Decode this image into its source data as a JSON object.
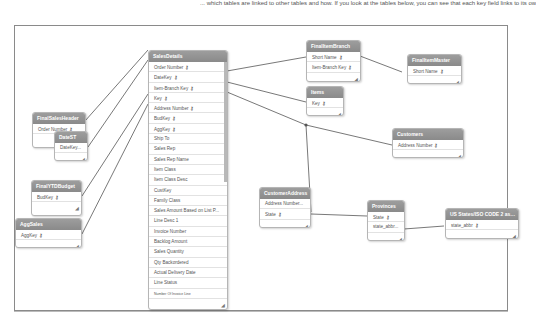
{
  "caption": "... which tables are linked to other tables and how. If you look at the tables below, you can see that each key field links to its own table.",
  "colors": {
    "header_bg": "#8f8f8f",
    "line": "#555555",
    "border": "#8a8a8a"
  },
  "tables": {
    "salesdetails": {
      "title": "SalesDetails",
      "fields": [
        {
          "name": "Order Number",
          "key": true
        },
        {
          "name": "DateKey",
          "key": true
        },
        {
          "name": "Item-Branch Key",
          "key": true
        },
        {
          "name": "Key",
          "key": true
        },
        {
          "name": "Address Number",
          "key": true
        },
        {
          "name": "BudKey",
          "key": true
        },
        {
          "name": "AggKey",
          "key": true
        },
        {
          "name": "Ship To",
          "key": false
        },
        {
          "name": "Sales Rep",
          "key": false
        },
        {
          "name": "Sales Rep Name",
          "key": false
        },
        {
          "name": "Item Class",
          "key": false
        },
        {
          "name": "Item Class Desc",
          "key": false
        },
        {
          "name": "CustKey",
          "key": false
        },
        {
          "name": "Family Class",
          "key": false
        },
        {
          "name": "Sales Amount Based on List P...",
          "key": false
        },
        {
          "name": "Line Desc 1",
          "key": false
        },
        {
          "name": "Invoice Number",
          "key": false
        },
        {
          "name": "Backlog Amount",
          "key": false
        },
        {
          "name": "Sales Quantity",
          "key": false
        },
        {
          "name": "Qty Backordered",
          "key": false
        },
        {
          "name": "Actual Delivery Date",
          "key": false
        },
        {
          "name": "Line Status",
          "key": false
        },
        {
          "name": "Number Of Invoice Line",
          "key": false
        }
      ]
    },
    "finalsalesheader": {
      "title": "FinalSalesHeader",
      "fields": [
        {
          "name": "Order Number",
          "key": true
        }
      ]
    },
    "datest": {
      "title": "DateST",
      "fields": [
        {
          "name": "DateKey...",
          "key": false
        }
      ]
    },
    "finalytdbudget": {
      "title": "FinalYTDBudget",
      "fields": [
        {
          "name": "BudKey",
          "key": true
        }
      ]
    },
    "aggsales": {
      "title": "AggSales",
      "fields": [
        {
          "name": "AggKey",
          "key": true
        }
      ]
    },
    "finalitembranch": {
      "title": "FinalItemBranch",
      "fields": [
        {
          "name": "Short Name",
          "key": true
        },
        {
          "name": "Item-Branch Key",
          "key": true
        }
      ]
    },
    "finalitemmaster": {
      "title": "FinalItemMaster",
      "fields": [
        {
          "name": "Short Name",
          "key": true
        }
      ]
    },
    "items": {
      "title": "Items",
      "fields": [
        {
          "name": "Key",
          "key": true
        }
      ]
    },
    "customers": {
      "title": "Customers",
      "fields": [
        {
          "name": "Address Number",
          "key": true
        }
      ]
    },
    "customeraddress": {
      "title": "CustomerAddress",
      "fields": [
        {
          "name": "Address Number...",
          "key": false
        },
        {
          "name": "State",
          "key": true
        }
      ]
    },
    "provinces": {
      "title": "Provinces",
      "fields": [
        {
          "name": "State",
          "key": true
        },
        {
          "name": "state_abbr...",
          "key": false
        }
      ]
    },
    "usstates": {
      "title": "US States/ISO CODE 2 assignm",
      "fields": [
        {
          "name": "state_abbr",
          "key": true
        }
      ]
    }
  },
  "icons": {
    "key": "⚷",
    "resize": "◢"
  }
}
